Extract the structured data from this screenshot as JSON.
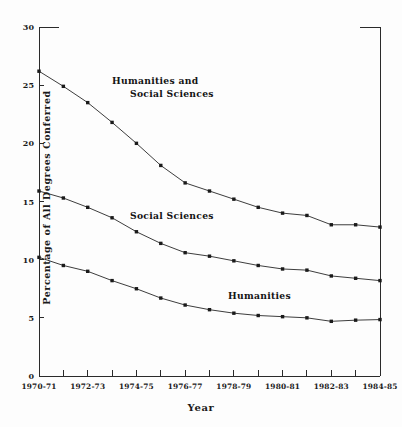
{
  "chart_data": {
    "type": "line",
    "title": "",
    "xlabel": "Year",
    "ylabel": "Percentage of All Degrees Conferred",
    "ylim": [
      0,
      30
    ],
    "yticks": [
      0,
      5,
      10,
      15,
      20,
      25,
      30
    ],
    "ytick_labels": [
      "0",
      "5",
      "10",
      "15",
      "20",
      "25",
      "30"
    ],
    "grid": false,
    "legend_position": "inline-annotations",
    "x": [
      "1970-71",
      "1971-72",
      "1972-73",
      "1973-74",
      "1974-75",
      "1975-76",
      "1976-77",
      "1977-78",
      "1978-79",
      "1979-80",
      "1980-81",
      "1981-82",
      "1982-83",
      "1983-84",
      "1984-85"
    ],
    "xtick_labels": [
      "1970-71",
      "1972-73",
      "1974-75",
      "1976-77",
      "1978-79",
      "1980-81",
      "1982-83",
      "1984-85"
    ],
    "xtick_label_indices": [
      0,
      2,
      4,
      6,
      8,
      10,
      12,
      14
    ],
    "categories": [
      "1970-71",
      "1971-72",
      "1972-73",
      "1973-74",
      "1974-75",
      "1975-76",
      "1976-77",
      "1977-78",
      "1978-79",
      "1979-80",
      "1980-81",
      "1981-82",
      "1982-83",
      "1983-84",
      "1984-85"
    ],
    "series": [
      {
        "name": "Humanities and Social Sciences",
        "annotation_lines": [
          "Humanities and",
          "Social Sciences"
        ],
        "color": "#1a1a1a",
        "values": [
          26.2,
          24.9,
          23.5,
          21.8,
          20.0,
          18.1,
          16.6,
          15.9,
          15.2,
          14.5,
          14.0,
          13.8,
          13.0,
          13.0,
          12.8
        ]
      },
      {
        "name": "Social Sciences",
        "annotation_lines": [
          "Social Sciences"
        ],
        "color": "#1a1a1a",
        "values": [
          15.9,
          15.3,
          14.5,
          13.6,
          12.4,
          11.4,
          10.6,
          10.3,
          9.9,
          9.5,
          9.2,
          9.1,
          8.6,
          8.4,
          8.2
        ]
      },
      {
        "name": "Humanities",
        "annotation_lines": [
          "Humanities"
        ],
        "color": "#1a1a1a",
        "values": [
          10.2,
          9.5,
          9.0,
          8.2,
          7.5,
          6.7,
          6.1,
          5.7,
          5.4,
          5.2,
          5.1,
          5.0,
          4.7,
          4.8,
          4.85
        ]
      }
    ],
    "annotations": [
      {
        "id": "ann-humanities-and-social-sciences",
        "lines": [
          "Humanities and",
          "Social Sciences"
        ],
        "x": 112,
        "y": 84
      },
      {
        "id": "ann-social-sciences",
        "lines": [
          "Social Sciences"
        ],
        "x": 130,
        "y": 219
      },
      {
        "id": "ann-humanities",
        "lines": [
          "Humanities"
        ],
        "x": 228,
        "y": 299
      }
    ]
  }
}
